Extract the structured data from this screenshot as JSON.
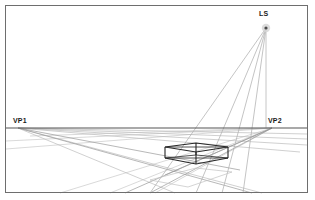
{
  "figure": {
    "canvas": {
      "width": 315,
      "height": 200,
      "background": "#ffffff"
    },
    "frame": {
      "name": "outer-border",
      "x": 5.5,
      "y": 5.5,
      "width": 302,
      "height": 187,
      "stroke": "#6e6e6e",
      "stroke_width": 1
    },
    "labels": {
      "vp1": "VP1",
      "vp2": "VP2",
      "ls": "LS"
    },
    "colors": {
      "border": "#6e6e6e",
      "horizon": "#555555",
      "construction_light": "#c9c9c9",
      "construction_mid": "#a8a8a8",
      "ray": "#b0b0b0",
      "box": "#262626",
      "ls_dot_outer": "#bdbdbd",
      "ls_dot_inner": "#4a4a4a",
      "label_text": "#1a1a1a"
    },
    "points": {
      "vp1": {
        "x": 18,
        "y": 128
      },
      "vp2": {
        "x": 272,
        "y": 128
      },
      "ls": {
        "x": 266,
        "y": 28
      },
      "ls_ground": {
        "x": 266,
        "y": 128
      }
    },
    "horizon_line": {
      "x1": 6,
      "y1": 128,
      "x2": 307,
      "y2": 128
    },
    "box": {
      "name": "perspective-cube",
      "top_face": [
        {
          "x": 165,
          "y": 147
        },
        {
          "x": 196,
          "y": 143
        },
        {
          "x": 228,
          "y": 147
        },
        {
          "x": 196,
          "y": 152
        }
      ],
      "bottom_face": [
        {
          "x": 165,
          "y": 158
        },
        {
          "x": 196,
          "y": 155
        },
        {
          "x": 228,
          "y": 158
        },
        {
          "x": 196,
          "y": 164
        }
      ],
      "vertical_edges": [
        {
          "x1": 165,
          "y1": 147,
          "x2": 165,
          "y2": 158
        },
        {
          "x1": 196,
          "y1": 143,
          "x2": 196,
          "y2": 155
        },
        {
          "x1": 228,
          "y1": 147,
          "x2": 228,
          "y2": 158
        },
        {
          "x1": 196,
          "y1": 152,
          "x2": 196,
          "y2": 164
        }
      ]
    },
    "light_rays": [
      {
        "name": "ray-to-near-corner",
        "x1": 266,
        "y1": 28,
        "x2": 150,
        "y2": 193
      },
      {
        "name": "ray-to-left-corner",
        "x1": 266,
        "y1": 28,
        "x2": 196,
        "y2": 193
      },
      {
        "name": "ray-to-front-corner",
        "x1": 266,
        "y1": 28,
        "x2": 222,
        "y2": 193
      },
      {
        "name": "ray-vertical-drop",
        "x1": 266,
        "y1": 28,
        "x2": 266,
        "y2": 128
      }
    ],
    "vp1_lines": [
      {
        "x2": 307,
        "y2": 135
      },
      {
        "x2": 307,
        "y2": 141
      },
      {
        "x2": 307,
        "y2": 147
      },
      {
        "x2": 290,
        "y2": 160
      },
      {
        "x2": 250,
        "y2": 193
      },
      {
        "x2": 175,
        "y2": 193
      }
    ],
    "vp2_lines": [
      {
        "x2": 6,
        "y2": 141
      },
      {
        "x2": 6,
        "y2": 149
      },
      {
        "x2": 60,
        "y2": 193
      },
      {
        "x2": 110,
        "y2": 193
      },
      {
        "x2": 155,
        "y2": 193
      }
    ]
  }
}
